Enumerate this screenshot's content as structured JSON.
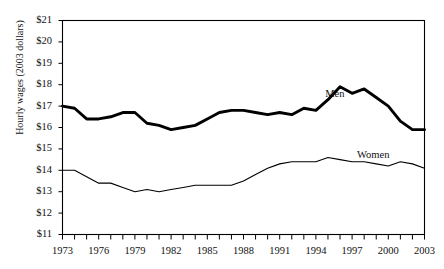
{
  "chart_data": {
    "type": "line",
    "title": "",
    "title_note": "chart title is cropped off the top edge of the screenshot and unreadable",
    "xlabel": "",
    "ylabel": "Hourly wages (2003 dollars)",
    "ylim": [
      11,
      21
    ],
    "xlim": [
      1973,
      2003
    ],
    "y_ticks": [
      "$11",
      "$12",
      "$13",
      "$14",
      "$15",
      "$16",
      "$17",
      "$18",
      "$19",
      "$20",
      "$21"
    ],
    "y_tick_values": [
      11,
      12,
      13,
      14,
      15,
      16,
      17,
      18,
      19,
      20,
      21
    ],
    "x_ticks_labeled": [
      "1973",
      "1976",
      "1979",
      "1982",
      "1985",
      "1988",
      "1991",
      "1994",
      "1997",
      "2000",
      "2003"
    ],
    "x_tick_values": [
      1973,
      1974,
      1975,
      1976,
      1977,
      1978,
      1979,
      1980,
      1981,
      1982,
      1983,
      1984,
      1985,
      1986,
      1987,
      1988,
      1989,
      1990,
      1991,
      1992,
      1993,
      1994,
      1995,
      1996,
      1997,
      1998,
      1999,
      2000,
      2001,
      2002,
      2003
    ],
    "grid": false,
    "legend": "inline-annotations",
    "x": [
      1973,
      1974,
      1975,
      1976,
      1977,
      1978,
      1979,
      1980,
      1981,
      1982,
      1983,
      1984,
      1985,
      1986,
      1987,
      1988,
      1989,
      1990,
      1991,
      1992,
      1993,
      1994,
      1995,
      1996,
      1997,
      1998,
      1999,
      2000,
      2001,
      2002,
      2003
    ],
    "series": [
      {
        "name": "Men",
        "style": "bold",
        "color": "#000000",
        "label_x": 1996.1,
        "label_y": 17.55,
        "values": [
          17.0,
          16.9,
          16.4,
          16.4,
          16.5,
          16.7,
          16.7,
          16.2,
          16.1,
          15.9,
          16.0,
          16.1,
          16.4,
          16.7,
          16.8,
          16.8,
          16.7,
          16.6,
          16.7,
          16.6,
          16.9,
          16.8,
          17.3,
          17.9,
          17.6,
          17.8,
          17.4,
          17.0,
          16.3,
          15.9,
          15.9
        ]
      },
      {
        "name": "Women",
        "style": "thin",
        "color": "#000000",
        "label_x": 1998.9,
        "label_y": 14.7,
        "values": [
          14.0,
          14.0,
          13.7,
          13.4,
          13.4,
          13.2,
          13.0,
          13.1,
          13.0,
          13.1,
          13.2,
          13.3,
          13.3,
          13.3,
          13.3,
          13.5,
          13.8,
          14.1,
          14.3,
          14.4,
          14.4,
          14.4,
          14.6,
          14.5,
          14.4,
          14.4,
          14.3,
          14.2,
          14.4,
          14.3,
          14.1
        ]
      }
    ],
    "series_values_note": "values read off the plotted curves; Men series is drawn with a heavy stroke, Women with a light stroke"
  },
  "annotations": {
    "men_label": "Men",
    "women_label": "Women"
  }
}
